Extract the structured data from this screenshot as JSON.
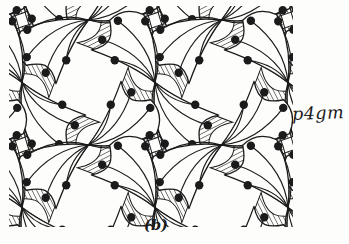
{
  "figure": {
    "symmetry_label": "p4gm",
    "caption": "(b)"
  },
  "colors": {
    "background": "#fdfdfb",
    "ink": "#1b1b1b",
    "fan_fill": "#fdfdfb"
  },
  "pattern": {
    "type": "wallpaper-tiling",
    "group": "p4gm",
    "canvas": {
      "width": 349,
      "height": 244
    },
    "clip": {
      "x": 9,
      "y": 6,
      "width": 284,
      "height": 221
    },
    "lattice": {
      "x0": 22,
      "y0": 20,
      "dx": 66.5,
      "dy": 62.5,
      "i_min": -1,
      "i_max": 5,
      "j_min": -1,
      "j_max": 4
    },
    "orientations": {
      "j_even": [
        135,
        315
      ],
      "j_odd": [
        45,
        225
      ]
    },
    "hatch": {
      "spacing": 3.4,
      "angle": 18,
      "line_width": 0.9
    },
    "motif": {
      "body_path": "M0 0Q24 30 56 40Q76 32 76 12C64 4 56 -4 68 -22Q30 -4 0 0Z",
      "underlay_scale": 1.22,
      "underlay_stroke_width": 0.8,
      "body_stroke_width": 1.3,
      "ray_stroke_width": 1.15,
      "dot_radius": 4.2,
      "rays": [
        {
          "c": [
            14.6,
            27.4
          ],
          "e": [
            50.2,
            36.4
          ]
        },
        {
          "c": [
            27.6,
            23.1
          ],
          "e": [
            69.9,
            17.4
          ]
        },
        {
          "c": [
            32.0,
            11.6
          ],
          "e": [
            67.6,
            -7.1
          ]
        },
        {
          "c": [
            22.7,
            4.0
          ],
          "e": [
            44.2,
            -12.7
          ]
        }
      ]
    }
  }
}
